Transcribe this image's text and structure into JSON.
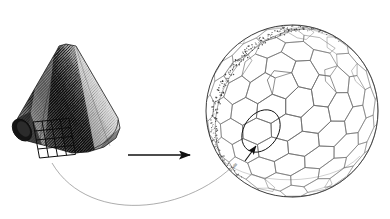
{
  "figure": {
    "background_color": "#ffffff",
    "ink_color": "#1a1a1a",
    "mesh_color": "#6e6e6e",
    "band_color": "#262626",
    "width": 390,
    "height": 219
  },
  "left_object": {
    "name": "shaded-cone-frustum",
    "description": "Tilted truncated cone rendered with dense diagonal hatch shading",
    "center": {
      "x": 72,
      "y": 108
    },
    "tilt_degrees": -34,
    "hatch_line_count": 96,
    "hatch_angle_degrees": 62,
    "grid_overlay": {
      "name": "surface-patch-grid",
      "rows": 4,
      "columns": 4,
      "origin": {
        "x": 33,
        "y": 122
      },
      "cell_size": 9
    }
  },
  "transform_arrow": {
    "name": "maps-to-arrow",
    "label": "",
    "from": {
      "x": 128,
      "y": 155
    },
    "to": {
      "x": 195,
      "y": 155
    },
    "head_length": 11,
    "head_width": 7
  },
  "leader_curve": {
    "name": "patch-correspondence-curve",
    "start": {
      "x": 52,
      "y": 165
    },
    "end": {
      "x": 245,
      "y": 150
    },
    "sag": 48
  },
  "right_object": {
    "name": "tessellated-sphere",
    "description": "Sphere covered by a hexagonal/pentagonal cell mesh with two stippled seam bands",
    "center": {
      "x": 292,
      "y": 111
    },
    "radius": 87,
    "cell_count": 62,
    "cell_rings": [
      1,
      6,
      12,
      18,
      25
    ],
    "seam_bands": [
      {
        "name": "seam-band-upper",
        "stipple_count": 120
      },
      {
        "name": "seam-band-lower",
        "stipple_count": 120
      }
    ]
  },
  "detail_marker": {
    "name": "zoom-detail-ellipse",
    "center": {
      "x": 261,
      "y": 131
    },
    "radius_x": 23,
    "radius_y": 17,
    "rotation_degrees": -55,
    "pointer": {
      "name": "detail-pointer-arrow",
      "from": {
        "x": 246,
        "y": 160
      },
      "to": {
        "x": 256,
        "y": 145
      }
    }
  },
  "annotation": {
    "name": "micro-annotation-label",
    "text": "cells",
    "position": {
      "x": 228,
      "y": 166
    },
    "rotation_degrees": -58
  }
}
